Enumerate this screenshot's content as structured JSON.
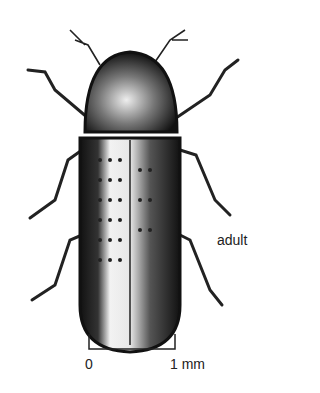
{
  "figure": {
    "stage_label": "adult",
    "scale_bar": {
      "start_label": "0",
      "end_label": "1 mm"
    }
  },
  "colors": {
    "ink": "#111111",
    "background": "#ffffff"
  }
}
